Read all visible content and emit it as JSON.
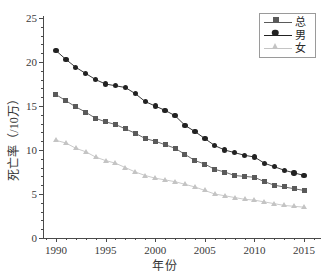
{
  "chart_data": {
    "type": "line",
    "title": "",
    "xlabel": "年份",
    "ylabel": "死亡率（/10万）",
    "xlim": [
      1988.7,
      2016.6
    ],
    "ylim": [
      0,
      25
    ],
    "xticks": [
      1990,
      1995,
      2000,
      2005,
      2010,
      2015
    ],
    "xtick_labels": [
      "1990",
      "1995",
      "2000",
      "2005",
      "2010",
      "2015"
    ],
    "yticks": [
      0,
      5,
      10,
      15,
      20,
      25
    ],
    "ytick_labels": [
      "0",
      "5",
      "10",
      "15",
      "20",
      "25"
    ],
    "grid": false,
    "legend_position": "top-right",
    "x": [
      1990,
      1991,
      1992,
      1993,
      1994,
      1995,
      1996,
      1997,
      1998,
      1999,
      2000,
      2001,
      2002,
      2003,
      2004,
      2005,
      2006,
      2007,
      2008,
      2009,
      2010,
      2011,
      2012,
      2013,
      2014,
      2015
    ],
    "series": [
      {
        "name": "总",
        "marker": "square",
        "color": "#5a5a5a",
        "values": [
          16.3,
          15.6,
          14.9,
          14.3,
          13.6,
          13.2,
          12.9,
          12.4,
          11.9,
          11.3,
          11.0,
          10.6,
          10.2,
          9.5,
          8.8,
          8.4,
          7.8,
          7.5,
          7.1,
          7.0,
          6.9,
          6.4,
          6.0,
          5.8,
          5.6,
          5.4
        ]
      },
      {
        "name": "男",
        "marker": "circle",
        "color": "#222222",
        "values": [
          21.3,
          20.3,
          19.4,
          18.7,
          18.0,
          17.5,
          17.3,
          17.1,
          16.4,
          15.5,
          15.0,
          14.5,
          13.9,
          12.8,
          12.1,
          11.3,
          10.5,
          10.0,
          9.7,
          9.4,
          9.2,
          8.5,
          8.1,
          7.7,
          7.4,
          7.1
        ]
      },
      {
        "name": "女",
        "marker": "triangle",
        "color": "#c4c4c4",
        "values": [
          11.1,
          10.8,
          10.2,
          9.8,
          9.2,
          8.8,
          8.5,
          8.0,
          7.5,
          7.1,
          6.8,
          6.6,
          6.4,
          6.1,
          5.8,
          5.4,
          5.0,
          4.8,
          4.6,
          4.4,
          4.3,
          4.1,
          3.9,
          3.7,
          3.6,
          3.5
        ]
      }
    ]
  }
}
